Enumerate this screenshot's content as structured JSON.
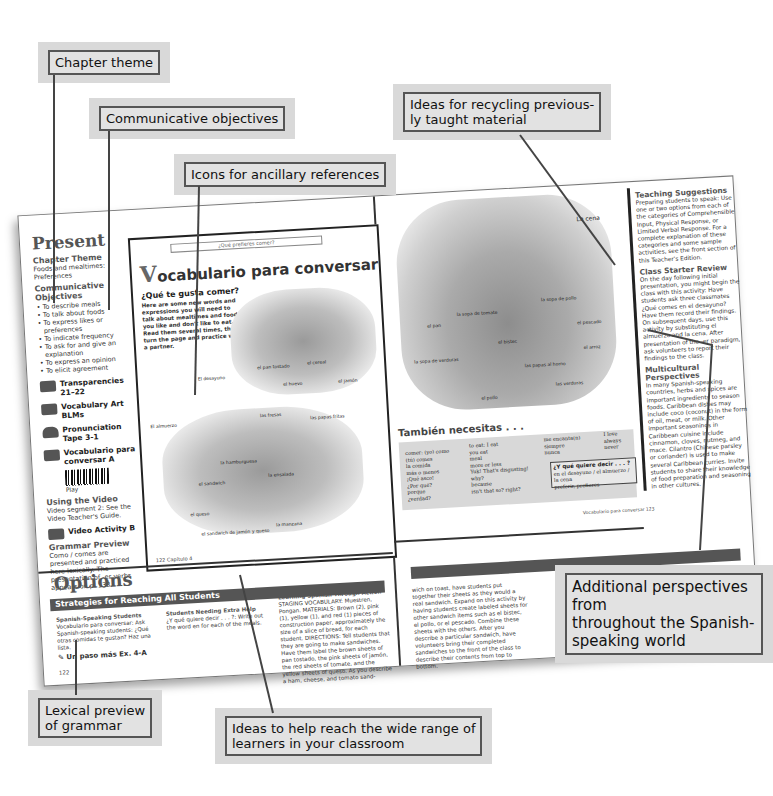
{
  "callouts": {
    "chapter_theme": "Chapter theme",
    "communicative_objectives": "Communicative objectives",
    "icons_ancillary": "Icons for ancillary references",
    "recycling": "Ideas for recycling previous-\nly taught material",
    "additional_perspectives": "Additional perspectives from\nthroughout the Spanish-\nspeaking world",
    "lexical_preview": "Lexical preview\nof grammar",
    "reach_learners": "Ideas to help reach the wide range of\nlearners in your classroom"
  },
  "sidebar": {
    "present": "Present",
    "chapter_theme_head": "Chapter Theme",
    "chapter_theme_text": "Foods and mealtimes: Preferences",
    "objectives_head": "Communicative Objectives",
    "objectives": [
      "To describe meals",
      "To talk about foods",
      "To express likes or preferences",
      "To indicate frequency",
      "To ask for and give an explanation",
      "To express an opinion",
      "To elicit agreement"
    ],
    "ancillaries": [
      {
        "icon": "transparency-icon",
        "label": "Transparencies 21–22"
      },
      {
        "icon": "vocabulary-art-icon",
        "label": "Vocabulary Art BLMs"
      },
      {
        "icon": "cassette-tape-icon",
        "label": "Pronunciation Tape 3-1"
      },
      {
        "icon": "videodisc-icon",
        "label": "Vocabulario para conversar A"
      }
    ],
    "play": "Play",
    "using_video_head": "Using the Video",
    "using_video_text": "Video segment 2: See the Video Teacher's Guide.",
    "video_activity": "Video Activity B",
    "grammar_head": "Grammar Preview",
    "grammar_text": "Como / comes are presented and practiced here lexically. The presentation of -er verbs appears on p. 138."
  },
  "inset": {
    "running_head": "¿Qué prefieres comer?",
    "title_initial": "V",
    "title_rest": "ocabulario para conversar",
    "subtitle": "¿Qué te gusta comer?",
    "intro": "Here are some new words and expressions you will need to talk about mealtimes and foods you like and don't like to eat. Read them several times, then turn the page and practice with a partner.",
    "labels_breakfast": [
      "El desayuno",
      "el pan tostado",
      "el cereal",
      "el huevo",
      "el jamón"
    ],
    "labels_lunch": [
      "El almuerzo",
      "las fresas",
      "las papas fritas",
      "la hamburguesa",
      "el sandwich",
      "la ensalada",
      "el queso",
      "el sandwich de jamón y queso",
      "la manzana"
    ],
    "page_footer": "122  Capítulo 4"
  },
  "right_page": {
    "scene_label": "La cena",
    "food_labels": [
      "el pan",
      "la sopa de tomate",
      "la sopa de pollo",
      "el bistec",
      "el pescado",
      "la sopa de verduras",
      "el arroz",
      "las papas al horno",
      "las verduras",
      "el pollo"
    ],
    "tambien_head": "También necesitas . . .",
    "col1": "comer: (yo) como\n       (tú) comes\nla comida\nmás o menos\n¡Qué asco!\n¿Por qué?\nporque\n¿verdad?",
    "col2": "to eat: I eat\n       you eat\nmeal\nmore or less\nYuk! That's disgusting!\nwhy?\nbecause\nisn't that so? right?",
    "col3": "me encanta(n)\nsiempre\nnunca",
    "col4": "I love\nalways\nnever",
    "quiere_head": "¿Y qué quiere decir . . . ?",
    "quiere_text": "en el desayuno / el almuerzo / la cena\npreferir, prefieres",
    "footer": "Vocabulario para conversar  123"
  },
  "teacher_col": {
    "teaching_head": "Teaching Suggestions",
    "teaching_text": "Preparing students to speak: Use one or two options from each of the categories of Comprehensible Input, Physical Response, or Limited Verbal Response. For a complete explanation of these categories and some sample activities, see the front section of this Teacher's Edition.",
    "review_head": "Class Starter Review",
    "review_text": "On the day following initial presentation, you might begin the class with this activity: Have students ask three classmates ¿Qué comes en el desayuno? Have them record their findings. On subsequent days, use this activity by substituting el almuerzo and la cena. After presentation of the -er paradigm, ask volunteers to report their findings to the class.",
    "multi_head": "Multicultural Perspectives",
    "multi_text": "In many Spanish-speaking countries, herbs and spices are important ingredients to season foods. Caribbean dishes may include coco (coconut) in the form of oil, meat, or milk. Other important seasonings in Caribbean cuisine include cinnamon, cloves, nutmeg, and mace. Cilantro (Chinese parsley or coriander) is used to make several Caribbean curries. Invite students to share their knowledge of food preparation and seasoning in other cultures."
  },
  "options": {
    "title": "Options",
    "bar": "Strategies for Reaching All Students",
    "col1_head": "Spanish-Speaking Students",
    "col1_text": "Vocabulario para conversar: Ask Spanish-speaking students: ¿Qué otras comidas te gustan? Haz una lista.",
    "col1_ref": "Un paso más Ex. 4-A",
    "col2_head": "Students Needing Extra Help",
    "col2_text": "¿Y qué quiere decir . . . ?: Write out the word en for each of the meals.",
    "col3_head": "Learning Spanish Through Action",
    "col3_text": "STAGING VOCABULARY: Muestren, Pongan. MATERIALS: Brown (2), pink (1), yellow (1), and red (1) pieces of construction paper, approximately the size of a slice of bread, for each student. DIRECTIONS: Tell students that they are going to make sandwiches. Have them label the brown sheets of pan tostado, the pink sheets of jamón, the red sheets of tomate, and the yellow sheets of queso. As you describe a ham, cheese, and tomato sand-",
    "col4_text": "wich on toast, have students put together their sheets as they would a real sandwich. Expand on this activity by having students create labeled sheets for other sandwich items such as el bistec, el pollo, or el pescado. Combine these sheets with the others. After you describe a particular sandwich, have volunteers bring their completed sandwiches to the front of the class to describe their contents from top to bottom.",
    "page_left": "122"
  }
}
